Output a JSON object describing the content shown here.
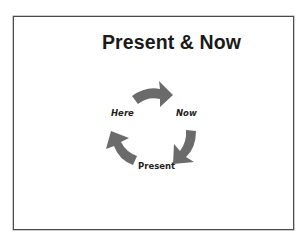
{
  "slide": {
    "title": "Present & Now",
    "border_color": "#4a4a4a",
    "background": "#ffffff"
  },
  "cycle_diagram": {
    "arrow_color": "#6b6b6b",
    "nodes": [
      {
        "label": "Here",
        "style": "bold-italic"
      },
      {
        "label": "Now",
        "style": "bold-italic"
      },
      {
        "label": "Present",
        "style": "bold"
      }
    ],
    "arrows": [
      {
        "name": "arrow-here-to-now",
        "direction": "clockwise",
        "icon": "curved-arrow-right-icon"
      },
      {
        "name": "arrow-now-to-present",
        "direction": "clockwise",
        "icon": "curved-arrow-down-left-icon"
      },
      {
        "name": "arrow-present-to-here",
        "direction": "clockwise",
        "icon": "curved-arrow-up-left-icon"
      }
    ]
  }
}
